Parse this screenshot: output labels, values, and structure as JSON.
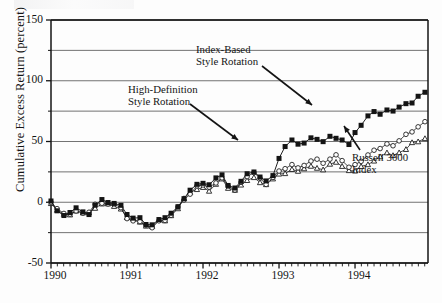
{
  "figure": {
    "background_color": "#fdfdfd",
    "ink_color": "#141414",
    "grid_color": "#5a5a5a"
  },
  "axes": {
    "y_axis_label": "Cumulative Excess Return (percent)",
    "y_ticks": [
      "150",
      "100",
      "50",
      "0",
      "-50"
    ],
    "y_tick_values": [
      150,
      100,
      50,
      0,
      -50
    ],
    "y_gridline_values": [
      150,
      125,
      100,
      75,
      50,
      25,
      0,
      -25,
      -50
    ],
    "x_ticks": [
      "1990",
      "1991",
      "1992",
      "1993",
      "1994"
    ],
    "x_tick_values": [
      1990,
      1991,
      1992,
      1993,
      1994
    ],
    "x_minor_tick_interval": "monthly"
  },
  "annotations": [
    {
      "name": "index-based-style-rotation",
      "line1": "Index-Based",
      "line2": "Style Rotation"
    },
    {
      "name": "high-definition-style-rotation",
      "line1": "High-Definition",
      "line2": "Style Rotation"
    },
    {
      "name": "russell-3000-index",
      "line1": "Russell 3000",
      "line2": "Index"
    }
  ],
  "chart_data": {
    "type": "line",
    "title": "",
    "xlabel": "",
    "ylabel": "Cumulative Excess Return (percent)",
    "xlim": [
      1990.0,
      1994.96
    ],
    "ylim": [
      -50,
      150
    ],
    "grid": true,
    "legend_position": "inline-annotations",
    "x": [
      1990.0,
      1990.08,
      1990.17,
      1990.25,
      1990.33,
      1990.42,
      1990.5,
      1990.58,
      1990.67,
      1990.75,
      1990.83,
      1990.92,
      1991.0,
      1991.08,
      1991.17,
      1991.25,
      1991.33,
      1991.42,
      1991.5,
      1991.58,
      1991.67,
      1991.75,
      1991.83,
      1991.92,
      1992.0,
      1992.08,
      1992.17,
      1992.25,
      1992.33,
      1992.42,
      1992.5,
      1992.58,
      1992.67,
      1992.75,
      1992.83,
      1992.92,
      1993.0,
      1993.08,
      1993.17,
      1993.25,
      1993.33,
      1993.42,
      1993.5,
      1993.58,
      1993.67,
      1993.75,
      1993.83,
      1993.92,
      1994.0,
      1994.08,
      1994.17,
      1994.25,
      1994.33,
      1994.42,
      1994.5,
      1994.58,
      1994.67,
      1994.75,
      1994.83,
      1994.92
    ],
    "series": [
      {
        "name": "Index-Based Style Rotation",
        "marker": "filled-square",
        "color": "#101010",
        "values": [
          0,
          -6,
          -10,
          -9,
          -5,
          -7,
          -9,
          -3,
          1,
          1,
          -1,
          -4,
          -11,
          -13,
          -14,
          -18,
          -20,
          -15,
          -13,
          -9,
          -4,
          4,
          9,
          14,
          17,
          13,
          19,
          23,
          14,
          12,
          17,
          24,
          26,
          21,
          18,
          22,
          36,
          46,
          52,
          47,
          49,
          53,
          52,
          51,
          53,
          52,
          50,
          47,
          57,
          64,
          71,
          76,
          73,
          77,
          74,
          79,
          82,
          83,
          86,
          92
        ]
      },
      {
        "name": "High-Definition Style Rotation",
        "marker": "open-circle",
        "color": "#101010",
        "values": [
          0,
          -6,
          -10,
          -9,
          -6,
          -8,
          -9,
          -3,
          0,
          0,
          -2,
          -5,
          -12,
          -14,
          -15,
          -19,
          -20,
          -16,
          -14,
          -10,
          -5,
          3,
          8,
          12,
          14,
          11,
          16,
          20,
          12,
          10,
          15,
          21,
          23,
          19,
          16,
          20,
          25,
          27,
          31,
          29,
          30,
          33,
          34,
          32,
          36,
          38,
          34,
          28,
          30,
          35,
          39,
          42,
          45,
          48,
          47,
          50,
          55,
          59,
          62,
          66
        ]
      },
      {
        "name": "Russell 3000 Index",
        "marker": "open-triangle",
        "color": "#101010",
        "values": [
          0,
          -6,
          -10,
          -9,
          -6,
          -8,
          -10,
          -4,
          0,
          0,
          -2,
          -5,
          -12,
          -14,
          -16,
          -19,
          -21,
          -16,
          -14,
          -11,
          -6,
          2,
          7,
          11,
          13,
          10,
          15,
          18,
          11,
          9,
          13,
          19,
          21,
          17,
          14,
          18,
          23,
          25,
          28,
          26,
          27,
          29,
          29,
          27,
          31,
          33,
          30,
          25,
          26,
          30,
          32,
          35,
          37,
          40,
          39,
          42,
          45,
          48,
          50,
          53
        ]
      }
    ],
    "series_continuation": {
      "note": "Series continue through 1994 year-end at approximately 100 (Index-Based), 78 (High-Definition), 57 (Russell 3000)",
      "final_values": [
        100,
        78,
        57
      ]
    }
  }
}
